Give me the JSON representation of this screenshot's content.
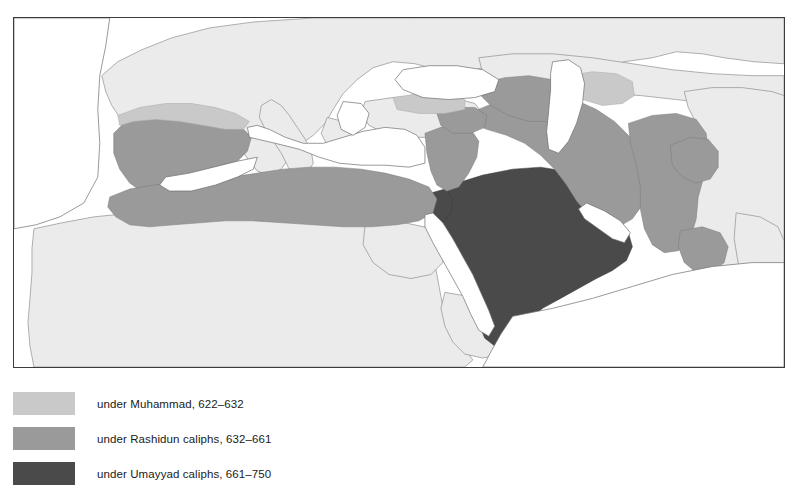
{
  "figure": {
    "kind": "historical-map",
    "frame_border_color": "#3c3c3c"
  },
  "map": {
    "water_color": "#ffffff",
    "land_unshaded_color": "#ebebeb",
    "border_line_color": "#8c8c8c",
    "coast_line_color": "#6e6e6e",
    "regions": [
      {
        "key": "muhammad",
        "color": "#c9c9c9"
      },
      {
        "key": "rashidun",
        "color": "#9a9a9a"
      },
      {
        "key": "umayyad",
        "color": "#4a4a4a"
      }
    ]
  },
  "legend": {
    "items": [
      {
        "swatch_color": "#c9c9c9",
        "label": "under Muhammad, 622–632"
      },
      {
        "swatch_color": "#9a9a9a",
        "label": "under Rashidun caliphs, 632–661"
      },
      {
        "swatch_color": "#4a4a4a",
        "label": "under Umayyad caliphs, 661–750"
      }
    ]
  }
}
